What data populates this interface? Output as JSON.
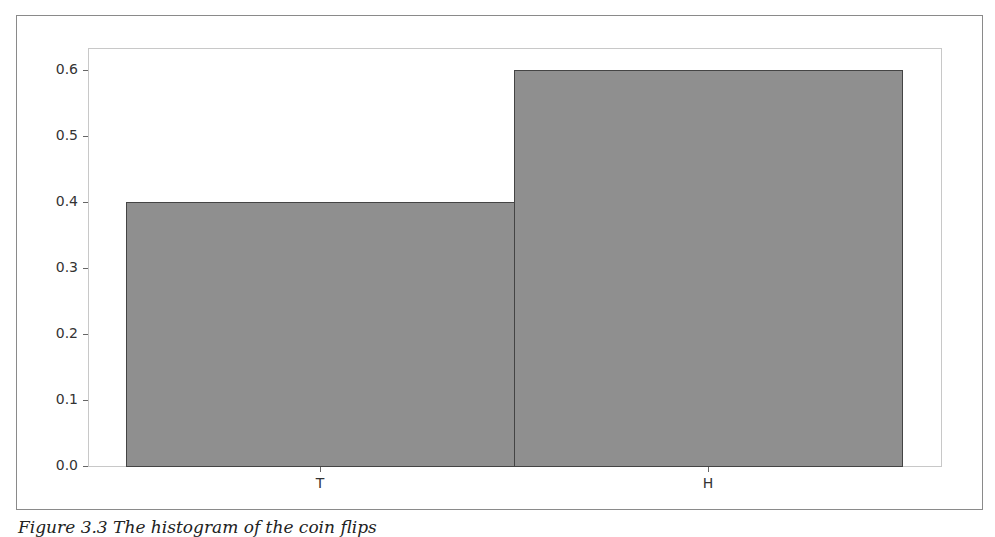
{
  "chart_data": {
    "type": "bar",
    "title": "",
    "xlabel": "",
    "ylabel": "",
    "categories": [
      "T",
      "H"
    ],
    "values": [
      0.4,
      0.6
    ],
    "ylim": [
      0.0,
      0.63
    ],
    "yticks": [
      "0.0",
      "0.1",
      "0.2",
      "0.3",
      "0.4",
      "0.5",
      "0.6"
    ],
    "grid": false,
    "legend": null,
    "bar_color": "#8f8f8f",
    "edge_color": "#444444"
  },
  "caption": "Figure 3.3 The histogram of the coin flips"
}
